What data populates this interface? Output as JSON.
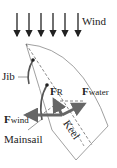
{
  "diagram": {
    "wind_label": "Wind",
    "jib_label": "Jib",
    "mainsail_label": "Mainsail",
    "keel_label": "Keel",
    "forces": {
      "resultant": {
        "symbol": "F",
        "subscript": "R"
      },
      "water": {
        "symbol": "F",
        "subscript": "water"
      },
      "wind": {
        "symbol": "F",
        "subscript": "wind"
      }
    },
    "colors": {
      "arrow": "#666666",
      "line": "#222222",
      "hull": "#888888"
    }
  }
}
